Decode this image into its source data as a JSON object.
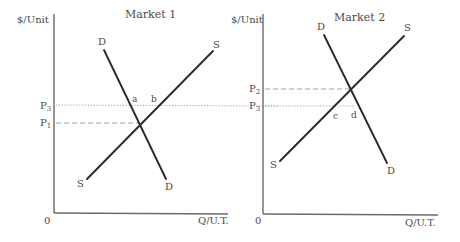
{
  "diagram": {
    "type": "supply-demand",
    "panels": [
      {
        "title": "Market 1",
        "y_axis_label": "$/Unit",
        "x_axis_label": "Q/U.T.",
        "origin_label": "0",
        "demand_label": "D",
        "supply_label": "S",
        "price_labels": {
          "upper": "P",
          "upper_sub": "3",
          "lower": "P",
          "lower_sub": "1"
        },
        "point_labels": [
          "a",
          "b"
        ]
      },
      {
        "title": "Market 2",
        "y_axis_label": "$/Unit",
        "x_axis_label": "Q/U.T.",
        "origin_label": "0",
        "demand_label": "D",
        "supply_label": "S",
        "price_labels": {
          "upper": "P",
          "upper_sub": "2",
          "lower": "P",
          "lower_sub": "3"
        },
        "point_labels": [
          "c",
          "d"
        ]
      }
    ]
  }
}
